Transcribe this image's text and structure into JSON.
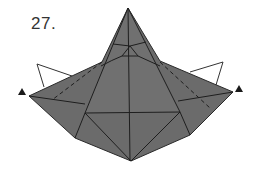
{
  "step": {
    "label": "27."
  },
  "colors": {
    "paper_fill": "#6b6b6b",
    "paper_fill_light": "#747474",
    "crease_line": "#1e1e1e",
    "outline_line": "#333333",
    "arrow_marker": "#1a1a1a",
    "background": "#ffffff"
  },
  "diagram": {
    "markers": [
      {
        "name": "left-point-marker",
        "shape": "triangle"
      },
      {
        "name": "right-point-marker",
        "shape": "triangle"
      }
    ],
    "flaps": [
      {
        "name": "left-flap-outline"
      },
      {
        "name": "right-flap-outline"
      }
    ]
  }
}
